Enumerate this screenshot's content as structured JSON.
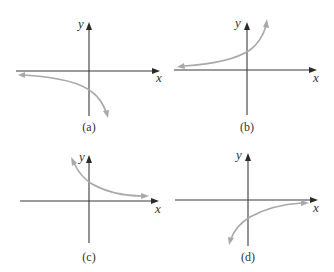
{
  "figure": {
    "panels": [
      {
        "id": "a",
        "caption": "(a)",
        "x_label": "x",
        "y_label": "y",
        "description": "Decreasing curve below x-axis: approaches x-axis from below on the left, falls steeply toward negative infinity on the right",
        "y_intercept_sign": "negative"
      },
      {
        "id": "b",
        "caption": "(b)",
        "x_label": "x",
        "y_label": "y",
        "description": "Increasing curve above x-axis: approaches x-axis from above on the left, rises steeply on the right",
        "y_intercept_sign": "positive"
      },
      {
        "id": "c",
        "caption": "(c)",
        "x_label": "x",
        "y_label": "y",
        "description": "Decreasing curve above x-axis: rises steeply on the left, approaches x-axis from above on the right",
        "y_intercept_sign": "positive"
      },
      {
        "id": "d",
        "caption": "(d)",
        "x_label": "x",
        "y_label": "y",
        "description": "Increasing curve below x-axis: falls steeply on the left, approaches x-axis from below on the right",
        "y_intercept_sign": "negative"
      }
    ],
    "colors": {
      "axis": "#3a3a3a",
      "curve": "#a9a9a9",
      "background": "#ffffff"
    }
  }
}
